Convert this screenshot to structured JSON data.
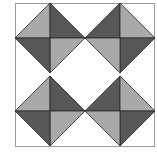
{
  "figure": {
    "colors": {
      "light": "#a9a9a9",
      "dark": "#575757",
      "stroke": "#2a2a2a",
      "frame": "#9a9a9a",
      "background": "#ffffff"
    },
    "frame": {
      "x": 15,
      "y": 3,
      "width": 139,
      "height": 143
    },
    "diamonds": [
      {
        "name": "top-left",
        "cx": 50,
        "cy": 38,
        "r": 35,
        "quadrants": {
          "tl": "light",
          "tr": "dark",
          "bl": "dark",
          "br": "light"
        }
      },
      {
        "name": "top-right",
        "cx": 120,
        "cy": 38,
        "r": 35,
        "quadrants": {
          "tl": "dark",
          "tr": "light",
          "bl": "light",
          "br": "dark"
        }
      },
      {
        "name": "bottom-left",
        "cx": 50,
        "cy": 111,
        "r": 35,
        "quadrants": {
          "tl": "light",
          "tr": "dark",
          "bl": "dark",
          "br": "light"
        }
      },
      {
        "name": "bottom-right",
        "cx": 120,
        "cy": 111,
        "r": 35,
        "quadrants": {
          "tl": "dark",
          "tr": "light",
          "bl": "light",
          "br": "dark"
        }
      }
    ]
  }
}
